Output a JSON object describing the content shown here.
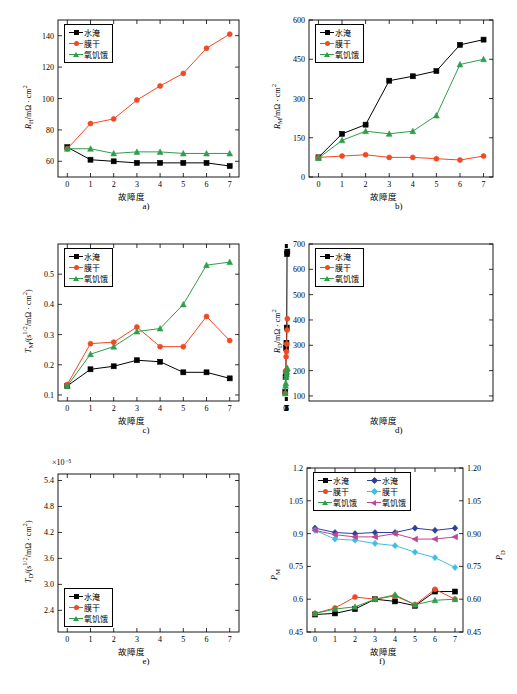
{
  "figure": {
    "panels": [
      {
        "id": "a",
        "caption": "a)",
        "chart_data": {
          "type": "line",
          "title": "",
          "xlabel": "故障degree",
          "xlabel_text": "故障度",
          "ylabel": "R_H/mΩ·cm²",
          "x": [
            0,
            1,
            2,
            3,
            4,
            5,
            6,
            7
          ],
          "xlim": [
            -0.4,
            7.4
          ],
          "ylim": [
            50,
            150
          ],
          "yticks": [
            60,
            80,
            100,
            120,
            140
          ],
          "xticks": [
            0,
            1,
            2,
            3,
            4,
            5,
            6,
            7
          ],
          "grid": false,
          "legend_position": "top-left",
          "series": [
            {
              "name": "水淹",
              "color": "#000000",
              "marker": "square",
              "values": [
                69,
                61,
                60,
                59,
                59,
                59,
                59,
                57
              ]
            },
            {
              "name": "膜干",
              "color": "#ef4a23",
              "marker": "circle",
              "values": [
                68,
                84,
                87,
                99,
                108,
                116,
                132,
                141
              ]
            },
            {
              "name": "氧饥饿",
              "color": "#2e9e4a",
              "marker": "triangle",
              "values": [
                68,
                68,
                65,
                66,
                66,
                65,
                65,
                65
              ]
            }
          ]
        }
      },
      {
        "id": "b",
        "caption": "b)",
        "chart_data": {
          "type": "line",
          "xlabel_text": "故障度",
          "ylabel": "R_M/mΩ·cm²",
          "x": [
            0,
            1,
            2,
            3,
            4,
            5,
            6,
            7
          ],
          "xlim": [
            -0.4,
            7.4
          ],
          "ylim": [
            0,
            600
          ],
          "yticks": [
            0,
            150,
            300,
            450,
            600
          ],
          "xticks": [
            0,
            1,
            2,
            3,
            4,
            5,
            6,
            7
          ],
          "grid": false,
          "legend_position": "top-left",
          "series": [
            {
              "name": "水淹",
              "color": "#000000",
              "marker": "square",
              "values": [
                75,
                165,
                200,
                368,
                385,
                405,
                505,
                525
              ]
            },
            {
              "name": "膜干",
              "color": "#ef4a23",
              "marker": "circle",
              "values": [
                75,
                80,
                85,
                75,
                75,
                70,
                65,
                80
              ]
            },
            {
              "name": "氧饥饿",
              "color": "#2e9e4a",
              "marker": "triangle",
              "values": [
                72,
                140,
                175,
                165,
                175,
                235,
                430,
                450
              ]
            }
          ]
        }
      },
      {
        "id": "c",
        "caption": "c)",
        "chart_data": {
          "type": "line",
          "xlabel_text": "故障度",
          "ylabel": "T_M/(s^0.5/mΩ·cm²)",
          "x": [
            0,
            1,
            2,
            3,
            4,
            5,
            6,
            7
          ],
          "xlim": [
            -0.4,
            7.4
          ],
          "ylim": [
            0.08,
            0.6
          ],
          "yticks": [
            0.1,
            0.2,
            0.3,
            0.4,
            0.5
          ],
          "xticks": [
            0,
            1,
            2,
            3,
            4,
            5,
            6,
            7
          ],
          "grid": false,
          "legend_position": "top-left",
          "series": [
            {
              "name": "水淹",
              "color": "#000000",
              "marker": "square",
              "values": [
                0.13,
                0.185,
                0.195,
                0.215,
                0.21,
                0.175,
                0.175,
                0.155
              ]
            },
            {
              "name": "膜干",
              "color": "#ef4a23",
              "marker": "circle",
              "values": [
                0.135,
                0.27,
                0.275,
                0.325,
                0.26,
                0.26,
                0.36,
                0.28
              ]
            },
            {
              "name": "氧饥饿",
              "color": "#2e9e4a",
              "marker": "triangle",
              "values": [
                0.13,
                0.235,
                0.26,
                0.31,
                0.32,
                0.4,
                0.53,
                0.54
              ]
            }
          ]
        }
      },
      {
        "id": "d",
        "caption": "d)",
        "chart_data": {
          "type": "line",
          "xlabel_text": "故障度",
          "ylabel": "R_D/mΩ·cm²",
          "x": [
            0,
            1,
            2,
            3,
            4,
            5,
            6,
            7
          ],
          "xlim": [
            80,
            700
          ],
          "ylim": [
            80,
            700
          ],
          "yticks": [
            100,
            200,
            300,
            400,
            500,
            600,
            700
          ],
          "xticks": [
            0,
            1,
            2,
            3,
            4,
            5,
            6,
            7
          ],
          "grid": false,
          "legend_position": "top-left",
          "series": [
            {
              "name": "水淹",
              "color": "#000000",
              "marker": "square",
              "values": [
                115,
                175,
                190,
                290,
                310,
                370,
                660,
                670
              ]
            },
            {
              "name": "膜干",
              "color": "#ef4a23",
              "marker": "circle",
              "values": [
                110,
                195,
                200,
                255,
                275,
                305,
                360,
                405
              ]
            },
            {
              "name": "氧饥饿",
              "color": "#2e9e4a",
              "marker": "triangle",
              "values": [
                110,
                140,
                150,
                175,
                185,
                195,
                205,
                210
              ]
            }
          ]
        }
      },
      {
        "id": "e",
        "caption": "e)",
        "exponent_label": "×10⁻⁵",
        "chart_data": {
          "type": "line",
          "xlabel_text": "故障度",
          "ylabel": "T_D/(s^0.5/mΩ·cm²)",
          "x": [
            0,
            1,
            2,
            3,
            4,
            5,
            6,
            7
          ],
          "xlim": [
            -0.4,
            7.4
          ],
          "ylim": [
            1.9e-05,
            5.55e-05
          ],
          "yticks": [
            2.4e-05,
            3e-05,
            3.6e-05,
            4.2e-05,
            4.8e-05,
            5.4e-05
          ],
          "ytick_labels": [
            "2.4",
            "3.0",
            "3.6",
            "4.2",
            "4.8",
            "5.4"
          ],
          "xticks": [
            0,
            1,
            2,
            3,
            4,
            5,
            6,
            7
          ],
          "grid": false,
          "legend_position": "bottom-left",
          "series": [
            {
              "name": "水淹",
              "color": "#000000",
              "marker": "square",
              "values": [
                3.6,
                4.9,
                5.1,
                5.1,
                4.7,
                4.95,
                4.9,
                4.65
              ]
            },
            {
              "name": "膜干",
              "color": "#ef4a23",
              "marker": "circle",
              "values": [
                3.6,
                3.55,
                3.55,
                3.5,
                3.55,
                2.85,
                2.75,
                2.3
              ]
            },
            {
              "name": "氧饥饿",
              "color": "#2e9e4a",
              "marker": "triangle",
              "values": [
                3.6,
                4.9,
                5.15,
                4.65,
                4.4,
                4.85,
                4.6,
                4.5
              ]
            }
          ]
        }
      },
      {
        "id": "f",
        "caption": "f)",
        "chart_data": {
          "type": "line",
          "xlabel_text": "故障度",
          "ylabel": "P_M",
          "ylabel_right": "P_D",
          "x": [
            0,
            1,
            2,
            3,
            4,
            5,
            6,
            7
          ],
          "xlim": [
            -0.4,
            7.4
          ],
          "ylim": [
            0.45,
            1.2
          ],
          "yticks": [
            0.45,
            0.6,
            0.75,
            0.9,
            1.05,
            1.2
          ],
          "yticks_right": [
            0.45,
            0.6,
            0.75,
            0.9,
            1.05,
            1.2
          ],
          "xticks": [
            0,
            1,
            2,
            3,
            4,
            5,
            6,
            7
          ],
          "grid": false,
          "legend_position": "top-left",
          "series": [
            {
              "name": "水淹",
              "axis": "left",
              "color": "#000000",
              "marker": "square",
              "values": [
                0.53,
                0.535,
                0.555,
                0.6,
                0.59,
                0.57,
                0.635,
                0.635
              ]
            },
            {
              "name": "膜干",
              "axis": "left",
              "color": "#ef4a23",
              "marker": "circle",
              "values": [
                0.535,
                0.56,
                0.61,
                0.6,
                0.615,
                0.575,
                0.645,
                0.6
              ]
            },
            {
              "name": "氧饥饿",
              "axis": "left",
              "color": "#2e9e4a",
              "marker": "triangle",
              "values": [
                0.535,
                0.555,
                0.565,
                0.6,
                0.62,
                0.575,
                0.595,
                0.6
              ]
            },
            {
              "name": "水淹",
              "axis": "right",
              "color": "#2b3f9e",
              "marker": "diamond",
              "values": [
                0.925,
                0.905,
                0.9,
                0.905,
                0.905,
                0.925,
                0.915,
                0.925
              ]
            },
            {
              "name": "膜干",
              "axis": "right",
              "color": "#3fbfe0",
              "marker": "diamond",
              "values": [
                0.915,
                0.875,
                0.87,
                0.855,
                0.845,
                0.815,
                0.79,
                0.745
              ]
            },
            {
              "name": "氧饥饿",
              "axis": "right",
              "color": "#c0458f",
              "marker": "left-triangle",
              "values": [
                0.915,
                0.895,
                0.885,
                0.885,
                0.9,
                0.875,
                0.875,
                0.885
              ]
            }
          ]
        }
      }
    ],
    "legend_labels": {
      "flooding": "水淹",
      "drying": "膜干",
      "oxygen_starvation": "氧饥饿"
    },
    "colors": {
      "black": "#000000",
      "red": "#ef4a23",
      "green": "#2e9e4a",
      "blue": "#2b3f9e",
      "cyan": "#3fbfe0",
      "magenta": "#c0458f"
    }
  }
}
